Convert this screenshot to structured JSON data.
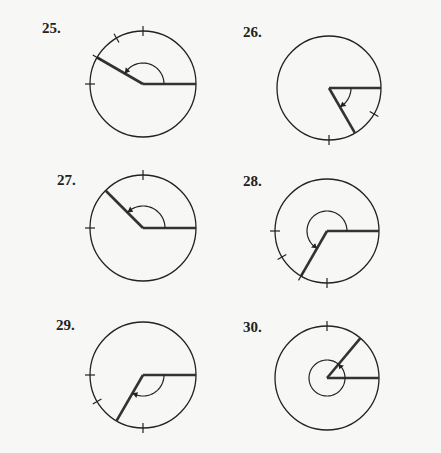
{
  "problems": [
    {
      "label": "25.",
      "lx": 42,
      "ly": 20,
      "cx": 143,
      "cy": 84,
      "r": 53,
      "terminal_deg": 150,
      "arc_r": 21,
      "arc_sweep_deg": 150,
      "ticks_deg": [
        90,
        120,
        150,
        180
      ]
    },
    {
      "label": "26.",
      "lx": 243,
      "ly": 24,
      "cx": 329,
      "cy": 88,
      "r": 52,
      "terminal_deg": -60,
      "arc_r": 22,
      "arc_sweep_deg": -60,
      "ticks_deg": [
        -30,
        -90
      ]
    },
    {
      "label": "27.",
      "lx": 57,
      "ly": 172,
      "cx": 143,
      "cy": 228,
      "r": 53,
      "terminal_deg": 135,
      "arc_r": 22,
      "arc_sweep_deg": 135,
      "ticks_deg": [
        90,
        180
      ]
    },
    {
      "label": "28.",
      "lx": 243,
      "ly": 173,
      "cx": 327,
      "cy": 231,
      "r": 52,
      "terminal_deg": 240,
      "arc_r": 20,
      "arc_sweep_deg": 240,
      "ticks_deg": [
        180,
        210,
        240,
        270
      ]
    },
    {
      "label": "29.",
      "lx": 56,
      "ly": 317,
      "cx": 143,
      "cy": 375,
      "r": 53,
      "terminal_deg": 240,
      "arc_r": 21,
      "arc_sweep_deg": -120,
      "ticks_deg": [
        180,
        210,
        270
      ]
    },
    {
      "label": "30.",
      "lx": 243,
      "ly": 319,
      "cx": 327,
      "cy": 378,
      "r": 52,
      "terminal_deg": 50,
      "arc_r": 18,
      "arc_sweep_deg": 410,
      "ticks_deg": [
        90
      ]
    }
  ],
  "colors": {
    "circle": "#222222",
    "ray": "#333333",
    "background": "#f7f7f5"
  }
}
